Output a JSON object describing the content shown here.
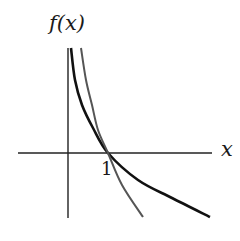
{
  "chart_data": {
    "type": "line",
    "title": "",
    "xlabel": "x",
    "ylabel": "f(x)",
    "x_ticks": [
      {
        "value": 1,
        "label": "1"
      }
    ],
    "xlim": [
      -1.25,
      3.6
    ],
    "ylim": [
      -1.625,
      2.625
    ],
    "grid": false,
    "legend": null,
    "annotations": [],
    "series": [
      {
        "name": "black-curve",
        "color": "#111111",
        "width": 2.6,
        "points": [
          [
            0.075,
            2.625
          ],
          [
            0.175,
            1.825
          ],
          [
            0.35,
            1.2
          ],
          [
            0.625,
            0.625
          ],
          [
            1,
            0
          ],
          [
            1.75,
            -0.675
          ],
          [
            2.6,
            -1.125
          ],
          [
            3.55,
            -1.6
          ]
        ]
      },
      {
        "name": "gray-curve",
        "color": "#555555",
        "width": 2.0,
        "points": [
          [
            0.325,
            2.625
          ],
          [
            0.45,
            1.825
          ],
          [
            0.6,
            1.2
          ],
          [
            0.75,
            0.575
          ],
          [
            1,
            0
          ],
          [
            1.35,
            -0.8
          ],
          [
            1.875,
            -1.6
          ]
        ]
      }
    ]
  },
  "labels": {
    "y_axis": "f(x)",
    "x_axis": "x",
    "tick_one": "1"
  },
  "layout": {
    "origin_px": [
      68,
      153
    ],
    "unit_px": 40,
    "axis_color": "#222222"
  }
}
